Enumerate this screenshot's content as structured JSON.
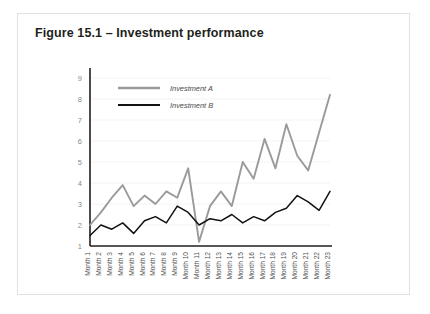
{
  "figure": {
    "title": "Figure 15.1 – Investment performance"
  },
  "chart_data": {
    "type": "line",
    "title": "Figure 15.1 – Investment performance",
    "xlabel": "",
    "ylabel": "",
    "ylim": [
      1,
      9
    ],
    "yticks": [
      1,
      2,
      3,
      4,
      5,
      6,
      7,
      8,
      9
    ],
    "ytick_labels": [
      "1",
      "2",
      "3",
      "4",
      "5",
      "6",
      "7",
      "8",
      "9"
    ],
    "grid": true,
    "legend_position": "top-left",
    "categories": [
      "Month 1",
      "Month 2",
      "Month 3",
      "Month 4",
      "Month 5",
      "Month 6",
      "Month 7",
      "Month 8",
      "Month 9",
      "Month 10",
      "Month 11",
      "Month 12",
      "Month 13",
      "Month 14",
      "Month 15",
      "Month 16",
      "Month 17",
      "Month 18",
      "Month 19",
      "Month 20",
      "Month 21",
      "Month 22",
      "Month 23"
    ],
    "series": [
      {
        "name": "Investment A",
        "color": "#9a9a9a",
        "values": [
          2.0,
          2.6,
          3.3,
          3.9,
          2.9,
          3.4,
          3.0,
          3.6,
          3.3,
          4.7,
          1.2,
          2.9,
          3.6,
          2.9,
          5.0,
          4.2,
          6.1,
          4.7,
          6.8,
          5.3,
          4.6,
          6.4,
          8.2
        ]
      },
      {
        "name": "Investment B",
        "color": "#121212",
        "values": [
          1.5,
          2.0,
          1.8,
          2.1,
          1.6,
          2.2,
          2.4,
          2.1,
          2.9,
          2.6,
          2.0,
          2.3,
          2.2,
          2.5,
          2.1,
          2.4,
          2.2,
          2.6,
          2.8,
          3.4,
          3.1,
          2.7,
          3.6
        ]
      }
    ],
    "legend": [
      {
        "label": "Investment A",
        "color": "#9a9a9a"
      },
      {
        "label": "Investment B",
        "color": "#121212"
      }
    ]
  },
  "colors": {
    "series_a": "#9a9a9a",
    "series_b": "#121212",
    "axis": "#231f20",
    "grid": "#f0f0f0",
    "card_border": "#e2e2e2",
    "title_text": "#231f20"
  }
}
